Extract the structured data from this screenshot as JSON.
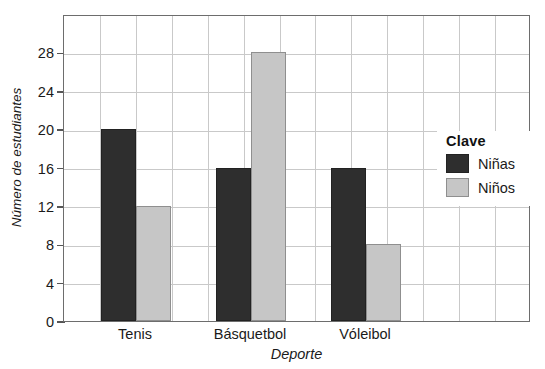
{
  "chart_data": {
    "type": "bar",
    "title": "",
    "xlabel": "Deporte",
    "ylabel": "Número de estudiantes",
    "categories": [
      "Tenis",
      "Básquetbol",
      "Vóleibol"
    ],
    "series": [
      {
        "name": "Niñas",
        "color": "#2e2e2e",
        "values": [
          20,
          16,
          16
        ]
      },
      {
        "name": "Niños",
        "color": "#c6c6c6",
        "values": [
          12,
          28,
          8
        ]
      }
    ],
    "ylim": [
      0,
      32
    ],
    "yticks": [
      0,
      4,
      8,
      12,
      16,
      20,
      24,
      28
    ],
    "ytick_labels": [
      "0",
      "4",
      "8",
      "12",
      "16",
      "20",
      "24",
      "28"
    ],
    "grid": true,
    "grid_x": true,
    "grid_y": true,
    "legend": {
      "title": "Clave",
      "position": "right-inside"
    }
  },
  "legend": {
    "title": "Clave",
    "entries": [
      {
        "label": "Niñas",
        "swatch": "ninas"
      },
      {
        "label": "Niños",
        "swatch": "ninos"
      }
    ]
  },
  "axes": {
    "y_title": "Número de estudiantes",
    "x_title": "Deporte"
  },
  "colors": {
    "ninas": "#2e2e2e",
    "ninos": "#c6c6c6",
    "frame": "#6d6d6d",
    "grid": "#c9c9c9"
  }
}
